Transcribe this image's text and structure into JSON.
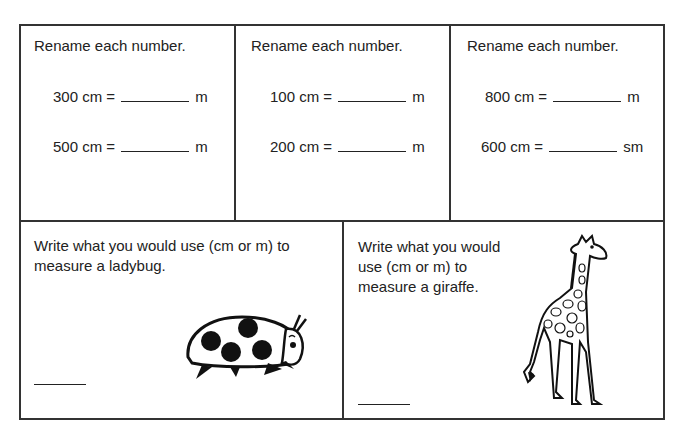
{
  "worksheet": {
    "top_cells": [
      {
        "instruction": "Rename each number.",
        "problems": [
          {
            "left": "300 cm =",
            "unit": "m"
          },
          {
            "left": "500 cm =",
            "unit": "m"
          }
        ]
      },
      {
        "instruction": "Rename each number.",
        "problems": [
          {
            "left": "100 cm =",
            "unit": "m"
          },
          {
            "left": "200 cm =",
            "unit": "m"
          }
        ]
      },
      {
        "instruction": "Rename each number.",
        "problems": [
          {
            "left": "800 cm =",
            "unit": "m"
          },
          {
            "left": "600 cm =",
            "unit": "sm"
          }
        ]
      }
    ],
    "bottom_cells": [
      {
        "line1": "Write what you would use (cm or m) to",
        "line2": "measure a ladybug.",
        "illustration": "ladybug-illustration"
      },
      {
        "line1": "Write what you would",
        "line2": "use (cm or m) to",
        "line3": "measure a giraffe.",
        "illustration": "giraffe-illustration"
      }
    ]
  }
}
